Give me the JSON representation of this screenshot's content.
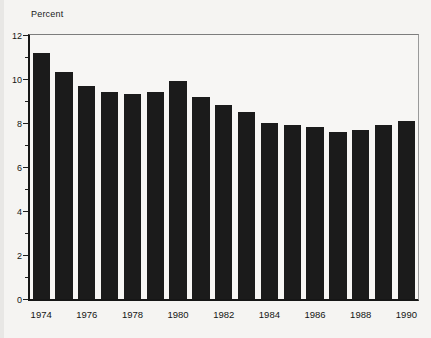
{
  "page": {
    "background": "#f5f4f2"
  },
  "chart_data": {
    "type": "bar",
    "title": "",
    "ylabel": "Percent",
    "xlabel": "",
    "categories": [
      "1974",
      "1975",
      "1976",
      "1977",
      "1978",
      "1979",
      "1980",
      "1981",
      "1982",
      "1983",
      "1984",
      "1985",
      "1986",
      "1987",
      "1988",
      "1989",
      "1990"
    ],
    "values": [
      11.2,
      10.3,
      9.7,
      9.4,
      9.3,
      9.4,
      9.9,
      9.2,
      8.8,
      8.5,
      8.0,
      7.9,
      7.8,
      7.6,
      7.7,
      7.9,
      8.1
    ],
    "ylim": [
      0,
      12
    ],
    "yticks_major": [
      0,
      2,
      4,
      6,
      8,
      10,
      12
    ],
    "yticks_minor": [
      1,
      3,
      5,
      7,
      9,
      11
    ],
    "xtick_labels": [
      "1974",
      "1976",
      "1978",
      "1980",
      "1982",
      "1984",
      "1986",
      "1988",
      "1990"
    ],
    "xtick_label_indices": [
      0,
      2,
      4,
      6,
      8,
      10,
      12,
      14,
      16
    ],
    "bar_color": "#1b1b1b",
    "axis_color": "#161616",
    "frame_color": "#8f8f8f",
    "grid": false,
    "legend": "none"
  }
}
